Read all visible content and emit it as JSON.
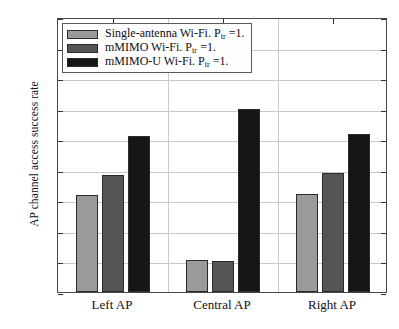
{
  "chart_data": {
    "type": "bar",
    "title": "",
    "xlabel": "",
    "ylabel": "AP channel access success rate",
    "categories": [
      "Left AP",
      "Central AP",
      "Right AP"
    ],
    "series": [
      {
        "name": "Single-antenna Wi-Fi. P_tr =1.",
        "name_prefix": "Single-antenna Wi-Fi. P",
        "name_sub": "tr",
        "name_suffix": " =1.",
        "color": "#9a9a9a",
        "values": [
          0.458,
          0.352,
          0.461
        ]
      },
      {
        "name": "mMIMO Wi-Fi. P_tr =1.",
        "name_prefix": "mMIMO Wi-Fi. P",
        "name_sub": "tr",
        "name_suffix": " =1.",
        "color": "#555555",
        "values": [
          0.492,
          0.35,
          0.494
        ]
      },
      {
        "name": "mMIMO-U Wi-Fi. P_tr =1.",
        "name_prefix": "mMIMO-U Wi-Fi. P",
        "name_sub": "tr",
        "name_suffix": " =1.",
        "color": "#161616",
        "values": [
          0.555,
          0.6,
          0.558
        ]
      }
    ],
    "ylim": [
      0.3,
      0.75
    ],
    "yticks": [
      "0.3",
      "0.35",
      "0.4",
      "0.45",
      "0.5",
      "0.55",
      "0.6",
      "0.65",
      "0.7",
      "0.75"
    ],
    "ytick_values": [
      0.3,
      0.35,
      0.4,
      0.45,
      0.5,
      0.55,
      0.6,
      0.65,
      0.7,
      0.75
    ],
    "grid": true,
    "legend_position": "upper left"
  }
}
